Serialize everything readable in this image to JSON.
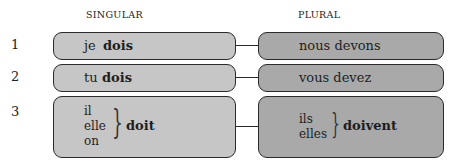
{
  "headers": {
    "singular": "SINGULAR",
    "plural": "PLURAL"
  },
  "rows": [
    {
      "number": "1",
      "singular": {
        "pronoun": "je",
        "verb": "dois"
      },
      "plural": {
        "text": "nous devons"
      }
    },
    {
      "number": "2",
      "singular": {
        "pronoun": "tu",
        "verb": "dois"
      },
      "plural": {
        "text": "vous devez"
      }
    },
    {
      "number": "3",
      "singular": {
        "pronouns": [
          "il",
          "elle",
          "on"
        ],
        "verb": "doit"
      },
      "plural": {
        "pronouns": [
          "ils",
          "elles"
        ],
        "verb": "doivent"
      }
    }
  ],
  "colors": {
    "singular_box": "#c6c6c6",
    "plural_box": "#a9a9a9",
    "border": "#2a2a2a"
  }
}
